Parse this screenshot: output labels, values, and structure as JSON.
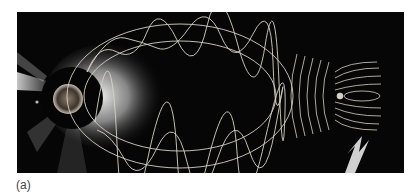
{
  "figure": {
    "panel_label": "(a)",
    "colors": {
      "background": "#060606",
      "field_lines": "#d8d2c4",
      "arrow": "#d0d0d0",
      "page": "#ffffff"
    },
    "elements": {
      "sun": "sun-with-occulter-disk",
      "flux_rope": "elliptical-twisted-flux-rope",
      "magnetosphere": "earth-magnetosphere-field-lines",
      "arrow": "direction-arrow"
    }
  }
}
